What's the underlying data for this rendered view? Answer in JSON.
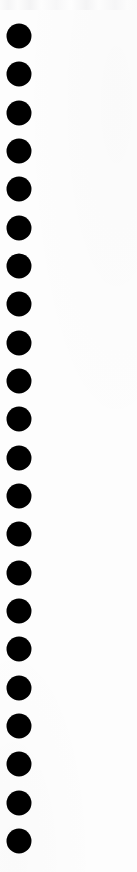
{
  "page": {
    "kind": "scanned-document-margin-strip",
    "width": 137,
    "height": 872,
    "background_color": "#fdfdfd",
    "has_text": false,
    "has_ui_chrome": false
  },
  "colors": {
    "hole_fill": "#000000",
    "paper": "#fdfdfd",
    "scan_noise": "#f4f4f5"
  },
  "hole_column": {
    "name": "binding-hole-column",
    "count": 22,
    "shape": "circle",
    "diameter_px": 25,
    "center_x_px": 18.5,
    "first_center_y_px": 36,
    "pitch_px": 38.33,
    "fill_color": "#000000",
    "holes": [
      {
        "index": 1,
        "cx": 18.5,
        "cy": 36,
        "d": 25
      },
      {
        "index": 2,
        "cx": 18.5,
        "cy": 74.3,
        "d": 25
      },
      {
        "index": 3,
        "cx": 18.5,
        "cy": 112.7,
        "d": 25
      },
      {
        "index": 4,
        "cx": 18.5,
        "cy": 151,
        "d": 25
      },
      {
        "index": 5,
        "cx": 18.5,
        "cy": 189.3,
        "d": 25
      },
      {
        "index": 6,
        "cx": 18.5,
        "cy": 227.7,
        "d": 25
      },
      {
        "index": 7,
        "cx": 18.5,
        "cy": 266,
        "d": 25
      },
      {
        "index": 8,
        "cx": 18.5,
        "cy": 304.3,
        "d": 25
      },
      {
        "index": 9,
        "cx": 18.5,
        "cy": 342.7,
        "d": 25
      },
      {
        "index": 10,
        "cx": 18.5,
        "cy": 381,
        "d": 25
      },
      {
        "index": 11,
        "cx": 18.5,
        "cy": 419.3,
        "d": 25
      },
      {
        "index": 12,
        "cx": 18.5,
        "cy": 457.7,
        "d": 25
      },
      {
        "index": 13,
        "cx": 18.5,
        "cy": 496,
        "d": 25
      },
      {
        "index": 14,
        "cx": 18.5,
        "cy": 534.3,
        "d": 25
      },
      {
        "index": 15,
        "cx": 18.5,
        "cy": 572.7,
        "d": 25
      },
      {
        "index": 16,
        "cx": 18.5,
        "cy": 611,
        "d": 25
      },
      {
        "index": 17,
        "cx": 18.5,
        "cy": 649.3,
        "d": 25
      },
      {
        "index": 18,
        "cx": 18.5,
        "cy": 687.7,
        "d": 25
      },
      {
        "index": 19,
        "cx": 18.5,
        "cy": 726,
        "d": 25
      },
      {
        "index": 20,
        "cx": 18.5,
        "cy": 764.3,
        "d": 25
      },
      {
        "index": 21,
        "cx": 18.5,
        "cy": 802.7,
        "d": 25
      },
      {
        "index": 22,
        "cx": 18.5,
        "cy": 841,
        "d": 25
      }
    ]
  }
}
